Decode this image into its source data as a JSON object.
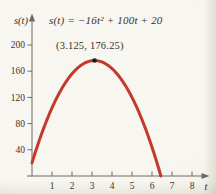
{
  "figure": {
    "equation_label": "s(t) = −16t² + 100t + 20",
    "vertex_label": "(3.125, 176.25)"
  },
  "colors": {
    "background": "#f7f5ef",
    "curve": "#c4392b",
    "point": "#1c1c1c",
    "axis": "#6b6b6b",
    "tick_text": "#3b352e",
    "label_text": "#383129"
  },
  "chart_data": {
    "type": "line",
    "title": "s(t) = −16t² + 100t + 20",
    "xlabel": "t",
    "ylabel": "s(t)",
    "curve": {
      "expression": "s(t) = -16t^2 + 100t + 20",
      "coefficients": {
        "a": -16,
        "b": 100,
        "c": 20
      },
      "t_drawn_range": [
        0,
        6.44
      ]
    },
    "vertex_point": {
      "t": 3.125,
      "s": 176.25,
      "label": "(3.125, 176.25)"
    },
    "s_intercept": 20,
    "t_intercept_approx": 6.44,
    "x_ticks": [
      1,
      2,
      3,
      4,
      5,
      6,
      7,
      8
    ],
    "y_ticks": [
      40,
      80,
      120,
      160,
      200
    ],
    "xlim": [
      0,
      8.8
    ],
    "ylim": [
      0,
      235
    ],
    "grid": false,
    "legend": "none"
  }
}
